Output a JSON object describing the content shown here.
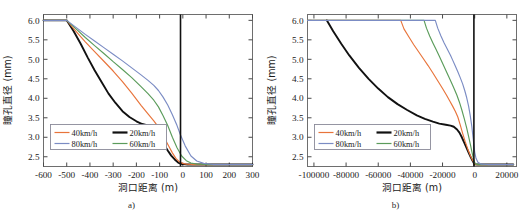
{
  "figure": {
    "panels": [
      {
        "id": "a",
        "caption": "a)",
        "xlabel": "洞口距离 (m)",
        "ylabel": "瞳孔直径 (mm)",
        "xticks": [
          "-600",
          "-500",
          "-400",
          "-300",
          "-200",
          "-100",
          "0",
          "100",
          "200",
          "300"
        ],
        "yticks": [
          "2.5",
          "3.0",
          "3.5",
          "4.0",
          "4.5",
          "5.0",
          "5.5",
          "6.0"
        ],
        "legend": [
          {
            "label": "40km/h",
            "color": "#E8743B"
          },
          {
            "label": "20km/h",
            "color": "#111111"
          },
          {
            "label": "80km/h",
            "color": "#7B8CC4"
          },
          {
            "label": "60km/h",
            "color": "#5B9C5B"
          }
        ]
      },
      {
        "id": "b",
        "caption": "b)",
        "xlabel": "洞口距离 (m)",
        "ylabel": "瞳孔直径 (mm)",
        "xticks": [
          "-100000",
          "-80000",
          "-60000",
          "-40000",
          "-20000",
          "0",
          "20000"
        ],
        "yticks": [
          "2.5",
          "3.0",
          "3.5",
          "4.0",
          "4.5",
          "5.0",
          "5.5",
          "6.0"
        ],
        "legend": [
          {
            "label": "40km/h",
            "color": "#E8743B"
          },
          {
            "label": "20km/h",
            "color": "#111111"
          },
          {
            "label": "80km/h",
            "color": "#7B8CC4"
          },
          {
            "label": "60km/h",
            "color": "#5B9C5B"
          }
        ]
      }
    ]
  },
  "chart_data": [
    {
      "type": "line",
      "panel": "a",
      "title": "",
      "xlabel": "洞口距离 (m)",
      "ylabel": "瞳孔直径 (mm)",
      "xlim": [
        -600,
        300
      ],
      "ylim": [
        2.25,
        6.15
      ],
      "xticks": [
        -600,
        -500,
        -400,
        -300,
        -200,
        -100,
        0,
        100,
        200,
        300
      ],
      "yticks": [
        2.5,
        3.0,
        3.5,
        4.0,
        4.5,
        5.0,
        5.5,
        6.0
      ],
      "grid": false,
      "legend_position": "lower-left",
      "annotations": [
        {
          "type": "vline",
          "x": -10,
          "color": "#111111"
        }
      ],
      "series": [
        {
          "name": "20km/h",
          "color": "#111111",
          "x": [
            -600,
            -500,
            -470,
            -440,
            -410,
            -380,
            -350,
            -320,
            -290,
            -260,
            -230,
            -200,
            -175,
            -155,
            -140,
            -125,
            -110,
            -95,
            -80,
            -65,
            -50,
            -35,
            -20,
            -10,
            0,
            20,
            60,
            150,
            300
          ],
          "y": [
            6.0,
            6.0,
            5.72,
            5.4,
            5.05,
            4.72,
            4.42,
            4.12,
            3.88,
            3.67,
            3.52,
            3.41,
            3.34,
            3.31,
            3.3,
            3.24,
            3.1,
            2.94,
            2.8,
            2.66,
            2.53,
            2.43,
            2.35,
            2.32,
            2.31,
            2.3,
            2.3,
            2.3,
            2.3
          ]
        },
        {
          "name": "40km/h",
          "color": "#E8743B",
          "x": [
            -600,
            -500,
            -460,
            -420,
            -380,
            -340,
            -300,
            -260,
            -220,
            -180,
            -150,
            -125,
            -105,
            -85,
            -65,
            -45,
            -30,
            -15,
            0,
            15,
            40,
            80,
            150,
            300
          ],
          "y": [
            6.0,
            6.0,
            5.72,
            5.45,
            5.2,
            4.95,
            4.7,
            4.43,
            4.13,
            3.82,
            3.6,
            3.42,
            3.26,
            3.05,
            2.82,
            2.6,
            2.46,
            2.37,
            2.33,
            2.31,
            2.3,
            2.3,
            2.3,
            2.3
          ]
        },
        {
          "name": "60km/h",
          "color": "#5B9C5B",
          "x": [
            -600,
            -500,
            -460,
            -420,
            -380,
            -340,
            -300,
            -260,
            -220,
            -180,
            -150,
            -125,
            -105,
            -85,
            -65,
            -45,
            -25,
            -5,
            15,
            35,
            60,
            100,
            160,
            300
          ],
          "y": [
            6.0,
            6.0,
            5.78,
            5.56,
            5.35,
            5.15,
            4.94,
            4.74,
            4.53,
            4.3,
            4.12,
            3.95,
            3.78,
            3.55,
            3.3,
            3.0,
            2.73,
            2.52,
            2.4,
            2.34,
            2.31,
            2.3,
            2.3,
            2.3
          ]
        },
        {
          "name": "80km/h",
          "color": "#7B8CC4",
          "x": [
            -600,
            -500,
            -460,
            -420,
            -380,
            -340,
            -300,
            -260,
            -220,
            -180,
            -150,
            -125,
            -105,
            -85,
            -65,
            -45,
            -25,
            -10,
            10,
            35,
            60,
            90,
            130,
            180,
            300
          ],
          "y": [
            6.0,
            6.0,
            5.82,
            5.64,
            5.47,
            5.3,
            5.13,
            4.96,
            4.78,
            4.6,
            4.46,
            4.33,
            4.2,
            4.03,
            3.83,
            3.58,
            3.3,
            3.06,
            2.78,
            2.52,
            2.39,
            2.33,
            2.3,
            2.3,
            2.3
          ]
        }
      ]
    },
    {
      "type": "line",
      "panel": "b",
      "title": "",
      "xlabel": "洞口距离 (m)",
      "ylabel": "瞳孔直径 (mm)",
      "xlim": [
        -104000,
        26000
      ],
      "ylim": [
        2.25,
        6.15
      ],
      "xticks": [
        -100000,
        -80000,
        -60000,
        -40000,
        -20000,
        0,
        20000
      ],
      "yticks": [
        2.5,
        3.0,
        3.5,
        4.0,
        4.5,
        5.0,
        5.5,
        6.0
      ],
      "grid": false,
      "legend_position": "lower-left",
      "annotations": [
        {
          "type": "vline",
          "x": -500,
          "color": "#111111"
        }
      ],
      "series": [
        {
          "name": "20km/h",
          "color": "#111111",
          "x": [
            -92000,
            -88000,
            -83000,
            -78000,
            -72000,
            -66000,
            -60000,
            -54000,
            -48000,
            -42000,
            -36000,
            -31000,
            -26000,
            -22000,
            -18000,
            -15000,
            -13000,
            -11000,
            -9500,
            -8000,
            -6500,
            -5000,
            -3500,
            -2500,
            -1500,
            -700,
            0,
            1500,
            5000,
            12000,
            24000
          ],
          "y": [
            6.0,
            5.72,
            5.4,
            5.1,
            4.78,
            4.5,
            4.25,
            4.03,
            3.85,
            3.7,
            3.56,
            3.47,
            3.4,
            3.35,
            3.32,
            3.3,
            3.27,
            3.2,
            3.12,
            3.0,
            2.86,
            2.72,
            2.58,
            2.49,
            2.41,
            2.35,
            2.31,
            2.3,
            2.3,
            2.3,
            2.3
          ]
        },
        {
          "name": "40km/h",
          "color": "#E8743B",
          "x": [
            -104000,
            -46000,
            -44000,
            -41000,
            -38000,
            -35000,
            -32000,
            -29000,
            -26000,
            -23000,
            -20000,
            -17500,
            -15500,
            -13500,
            -12000,
            -10500,
            -9000,
            -7500,
            -6000,
            -4500,
            -3000,
            -1800,
            -800,
            0,
            800,
            2000,
            5000,
            12000,
            24000
          ],
          "y": [
            6.0,
            6.0,
            5.78,
            5.58,
            5.38,
            5.2,
            5.02,
            4.84,
            4.65,
            4.45,
            4.25,
            4.08,
            3.93,
            3.78,
            3.66,
            3.52,
            3.32,
            3.1,
            2.9,
            2.72,
            2.56,
            2.45,
            2.37,
            2.32,
            2.3,
            2.3,
            2.3,
            2.3,
            2.3
          ]
        },
        {
          "name": "60km/h",
          "color": "#5B9C5B",
          "x": [
            -104000,
            -31500,
            -30000,
            -28000,
            -26000,
            -24000,
            -22000,
            -20000,
            -18000,
            -16000,
            -14000,
            -12500,
            -11000,
            -9500,
            -8000,
            -6500,
            -5000,
            -3800,
            -2600,
            -1600,
            -800,
            0,
            800,
            2000,
            5000,
            12000,
            24000
          ],
          "y": [
            6.0,
            6.0,
            5.8,
            5.6,
            5.42,
            5.25,
            5.08,
            4.9,
            4.72,
            4.54,
            4.36,
            4.22,
            4.07,
            3.9,
            3.7,
            3.48,
            3.24,
            3.02,
            2.8,
            2.6,
            2.45,
            2.35,
            2.31,
            2.3,
            2.3,
            2.3,
            2.3
          ]
        },
        {
          "name": "80km/h",
          "color": "#7B8CC4",
          "x": [
            -104000,
            -24500,
            -23000,
            -21000,
            -19000,
            -17000,
            -15000,
            -13500,
            -12000,
            -10500,
            -9000,
            -7500,
            -6200,
            -5000,
            -3800,
            -2800,
            -1800,
            -900,
            0,
            800,
            2000,
            4000,
            8000,
            14000,
            24000
          ],
          "y": [
            6.0,
            6.0,
            5.8,
            5.6,
            5.42,
            5.26,
            5.1,
            4.96,
            4.82,
            4.68,
            4.53,
            4.37,
            4.2,
            4.02,
            3.8,
            3.56,
            3.28,
            2.95,
            2.62,
            2.46,
            2.36,
            2.31,
            2.3,
            2.3,
            2.3
          ]
        }
      ]
    }
  ]
}
